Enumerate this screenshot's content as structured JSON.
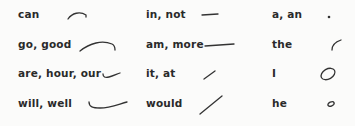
{
  "columns": [
    {
      "entries": [
        {
          "word": "can",
          "glyph": "small-arc-stroke"
        },
        {
          "word": "go, good",
          "glyph": "long-arc-stroke"
        },
        {
          "word": "are, hour, our",
          "glyph": "small-hook-curve-stroke"
        },
        {
          "word": "will, well",
          "glyph": "long-hook-curve-stroke"
        }
      ]
    },
    {
      "entries": [
        {
          "word": "in, not",
          "glyph": "short-horizontal-stroke"
        },
        {
          "word": "am, more",
          "glyph": "long-horizontal-stroke"
        },
        {
          "word": "it, at",
          "glyph": "short-diagonal-stroke"
        },
        {
          "word": "would",
          "glyph": "long-diagonal-stroke"
        }
      ]
    },
    {
      "entries": [
        {
          "word": "a, an",
          "glyph": "dot"
        },
        {
          "word": "the",
          "glyph": "small-upward-curve-stroke"
        },
        {
          "word": "I",
          "glyph": "large-circle"
        },
        {
          "word": "he",
          "glyph": "small-circle"
        }
      ]
    }
  ]
}
